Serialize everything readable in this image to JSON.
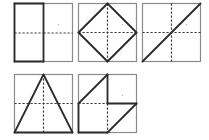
{
  "diagram": {
    "title": "",
    "colors": {
      "background": "#ffffff",
      "frame": "#8a8a8a",
      "bold": "#2a2a2a",
      "dashed": "#3a3a3a",
      "dot": "#b0b0b0"
    },
    "box_size": 58,
    "panels": [
      {
        "id": "panel-1",
        "x": 14,
        "y": 3,
        "description": "left half rectangle bold",
        "dashed": [
          [
            0,
            29.5,
            29,
            29.5
          ],
          [
            29,
            29.5,
            58,
            29.5
          ]
        ],
        "bold": [
          [
            0,
            0,
            29,
            0
          ],
          [
            29,
            0,
            29,
            58
          ],
          [
            29,
            58,
            0,
            58
          ],
          [
            0,
            58,
            0,
            0
          ]
        ],
        "dot": [
          44,
          21
        ]
      },
      {
        "id": "panel-2",
        "x": 78,
        "y": 3,
        "description": "diamond inscribed in square",
        "dashed": [
          [
            0,
            29,
            58,
            29
          ],
          [
            29,
            0,
            29,
            58
          ]
        ],
        "bold": [
          [
            29,
            0,
            58,
            29
          ],
          [
            58,
            29,
            29,
            58
          ],
          [
            29,
            58,
            0,
            29
          ],
          [
            0,
            29,
            29,
            0
          ]
        ],
        "dot": [
          44,
          21
        ]
      },
      {
        "id": "panel-3",
        "x": 142,
        "y": 3,
        "description": "diagonal from bottom-left to top-right",
        "dashed": [
          [
            0,
            29,
            58,
            29
          ],
          [
            29,
            0,
            29,
            58
          ]
        ],
        "bold": [
          [
            0,
            58,
            58,
            0
          ]
        ],
        "dot": [
          44,
          21
        ]
      },
      {
        "id": "panel-4",
        "x": 14,
        "y": 74,
        "description": "triangle apex at top-middle, base at bottom",
        "dashed": [
          [
            0,
            29,
            58,
            29
          ],
          [
            29,
            0,
            29,
            58
          ]
        ],
        "bold": [
          [
            29,
            0,
            58,
            58
          ],
          [
            58,
            58,
            0,
            58
          ],
          [
            0,
            58,
            29,
            0
          ]
        ],
        "dot": null
      },
      {
        "id": "panel-5",
        "x": 78,
        "y": 74,
        "description": "irregular polygon with notch",
        "dashed": [
          [
            0,
            29,
            29,
            29
          ],
          [
            29,
            29,
            29,
            58
          ]
        ],
        "bold": [
          [
            0,
            29,
            29,
            0
          ],
          [
            29,
            0,
            29,
            29
          ],
          [
            29,
            29,
            58,
            29
          ],
          [
            58,
            29,
            29,
            58
          ],
          [
            29,
            58,
            0,
            58
          ],
          [
            0,
            58,
            0,
            29
          ]
        ],
        "dot": [
          44,
          21
        ]
      }
    ]
  }
}
